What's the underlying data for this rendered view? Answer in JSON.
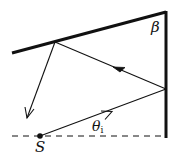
{
  "diagram": {
    "labels": {
      "beta": "β",
      "theta": "θ",
      "theta_subscript": "i",
      "source": "S"
    },
    "colors": {
      "line": "#111111",
      "background": "#ffffff"
    },
    "elements": {
      "slanted_mirror": {
        "from": [
          12,
          53
        ],
        "to": [
          166,
          12
        ]
      },
      "vertical_mirror": {
        "from": [
          166,
          12
        ],
        "to": [
          166,
          137
        ]
      },
      "baseline_dashed": {
        "from": [
          12,
          136
        ],
        "to": [
          166,
          136
        ]
      },
      "source_point": [
        40,
        136
      ],
      "incident_ray": {
        "from": [
          40,
          136
        ],
        "to": [
          166,
          89
        ]
      },
      "first_reflected_ray": {
        "from": [
          166,
          89
        ],
        "to": [
          55,
          42
        ]
      },
      "second_reflected_ray": {
        "from": [
          55,
          42
        ],
        "to": [
          27,
          118
        ]
      }
    }
  }
}
